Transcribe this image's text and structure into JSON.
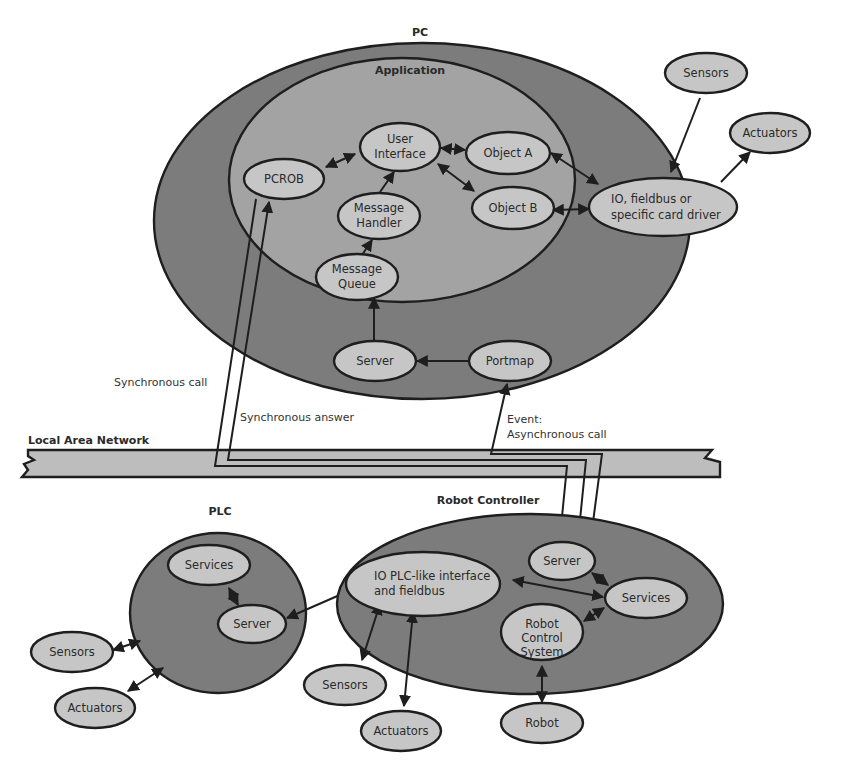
{
  "colors": {
    "background": "#ffffff",
    "container_dark": "#7c7c7c",
    "container_mid": "#a3a3a3",
    "node_fill": "#c6c6c6",
    "lan_fill": "#bdbdbd",
    "stroke": "#1e1e1e"
  },
  "pc": {
    "label": "PC",
    "application": {
      "label": "Application",
      "nodes": {
        "pcrob": "PCROB",
        "user_interface": [
          "User",
          "Interface"
        ],
        "object_a": "Object A",
        "object_b": "Object B",
        "message_handler": [
          "Message",
          "Handler"
        ],
        "message_queue": [
          "Message",
          "Queue"
        ]
      }
    },
    "nodes": {
      "io_driver": [
        "IO, fieldbus or",
        "specific card driver"
      ],
      "server": "Server",
      "portmap": "Portmap"
    },
    "external": {
      "sensors": "Sensors",
      "actuators": "Actuators"
    }
  },
  "network": {
    "label": "Local Area Network",
    "edge_labels": {
      "sync_call": "Synchronous call",
      "sync_answer": "Synchronous answer",
      "async_event": [
        "Event:",
        "Asynchronous call"
      ]
    }
  },
  "plc": {
    "label": "PLC",
    "nodes": {
      "services": "Services",
      "server": "Server"
    },
    "external": {
      "sensors": "Sensors",
      "actuators": "Actuators"
    }
  },
  "robot_controller": {
    "label": "Robot Controller",
    "nodes": {
      "io_plc": [
        "IO PLC-like interface",
        "and fieldbus"
      ],
      "server": "Server",
      "services": "Services",
      "robot_control_system": [
        "Robot",
        "Control",
        "System"
      ]
    },
    "external": {
      "sensors": "Sensors",
      "actuators": "Actuators",
      "robot": "Robot"
    }
  }
}
